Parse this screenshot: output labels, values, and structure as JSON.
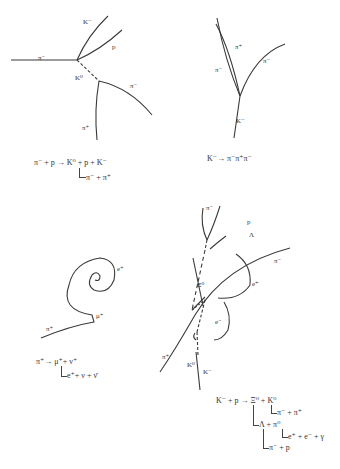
{
  "panels": [
    {
      "id": "panel-1",
      "track_labels": {
        "pi_minus_in": "π⁻",
        "k_minus": "K⁻",
        "proton": "p",
        "k0": "K⁰",
        "pi_minus_out": "π⁻",
        "pi_plus": "π⁺"
      },
      "equation": {
        "line1": "π⁻ + p → K⁰ + p + K⁻",
        "line2": "π⁻ + π⁺"
      }
    },
    {
      "id": "panel-2",
      "track_labels": {
        "pi_plus": "π⁺",
        "pi_minus_left": "π⁻",
        "pi_minus_right": "π⁻",
        "k_minus": "K⁻"
      },
      "equation": {
        "line1": "K⁻→ π⁻π⁺π⁻"
      }
    },
    {
      "id": "panel-3",
      "track_labels": {
        "e_plus": "e⁺",
        "mu_plus": "μ⁺",
        "pi_plus": "π⁺"
      },
      "equation": {
        "line1": "π⁺→ μ⁺+ ν⁺",
        "line2": "e⁺+ ν + ν̄"
      }
    },
    {
      "id": "panel-4",
      "track_labels": {
        "pi_minus_top": "π⁻",
        "proton": "p",
        "lambda": "Λ",
        "pi_minus_right": "π⁻",
        "xi0": "Ξ⁰",
        "e_plus": "e⁺",
        "e_minus": "e⁻",
        "pi_plus": "π⁺",
        "k0": "K⁰",
        "k_minus": "K⁻"
      },
      "equation": {
        "line1": "K⁻ + p → Ξ⁰ + K⁰",
        "line2": "π⁻ + π⁺",
        "line3": "Λ + π⁰",
        "line4": "e⁺ + e⁻ + γ",
        "line5": "π⁻ + p"
      }
    }
  ]
}
